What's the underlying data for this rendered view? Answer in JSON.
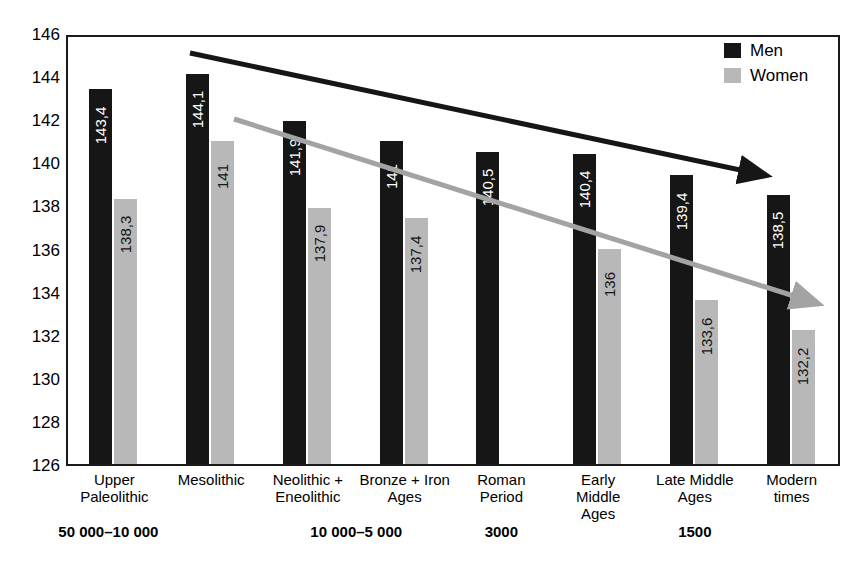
{
  "chart_data": {
    "type": "bar",
    "title": "",
    "xlabel": "",
    "ylabel": "",
    "ylim": [
      126,
      146
    ],
    "ytick_step": 2,
    "yticks": [
      "146",
      "144",
      "142",
      "140",
      "138",
      "136",
      "134",
      "132",
      "130",
      "128",
      "126"
    ],
    "grid": false,
    "legend_position": "top-right",
    "categories": [
      "Upper\nPaleolithic",
      "Mesolithic",
      "Neolithic +\nEneolithic",
      "Bronze + Iron\nAges",
      "Roman\nPeriod",
      "Early\nMiddle\nAges",
      "Late Middle\nAges",
      "Modern\ntimes"
    ],
    "series": [
      {
        "name": "Men",
        "color": "#161616",
        "values": [
          143.4,
          144.1,
          141.9,
          141,
          140.5,
          140.4,
          139.4,
          138.5
        ],
        "labels": [
          "143,4",
          "144,1",
          "141,9",
          "141",
          "140,5",
          "140,4",
          "139,4",
          "138,5"
        ]
      },
      {
        "name": "Women",
        "color": "#b8b8b8",
        "values": [
          138.3,
          141,
          137.9,
          137.4,
          null,
          136,
          133.6,
          132.2
        ],
        "labels": [
          "138,3",
          "141",
          "137,9",
          "137,4",
          "",
          "136",
          "133,6",
          "132,2"
        ]
      }
    ],
    "period_labels": [
      "50 000–10 000",
      "10 000–5 000",
      "3000",
      "1500"
    ],
    "annotations": [
      {
        "name": "men-trend-arrow",
        "color": "#161616",
        "note": "declining trend arrow for Men"
      },
      {
        "name": "women-trend-arrow",
        "color": "#a0a0a0",
        "note": "declining trend arrow for Women"
      }
    ]
  },
  "groups": [
    {
      "label_line1": "Upper",
      "label_line2": "Paleolithic",
      "label_line3": ""
    },
    {
      "label_line1": "Mesolithic",
      "label_line2": "",
      "label_line3": ""
    },
    {
      "label_line1": "Neolithic +",
      "label_line2": "Eneolithic",
      "label_line3": ""
    },
    {
      "label_line1": "Bronze + Iron",
      "label_line2": "Ages",
      "label_line3": ""
    },
    {
      "label_line1": "Roman",
      "label_line2": "Period",
      "label_line3": ""
    },
    {
      "label_line1": "Early",
      "label_line2": "Middle",
      "label_line3": "Ages"
    },
    {
      "label_line1": "Late Middle",
      "label_line2": "Ages",
      "label_line3": ""
    },
    {
      "label_line1": "Modern",
      "label_line2": "times",
      "label_line3": ""
    }
  ],
  "periods": [
    {
      "text": "50 000–10 000"
    },
    {
      "text": "10 000–5 000"
    },
    {
      "text": "3000"
    },
    {
      "text": "1500"
    }
  ],
  "legend": {
    "items": [
      {
        "label": "Men",
        "color": "#161616"
      },
      {
        "label": "Women",
        "color": "#b8b8b8"
      }
    ]
  }
}
